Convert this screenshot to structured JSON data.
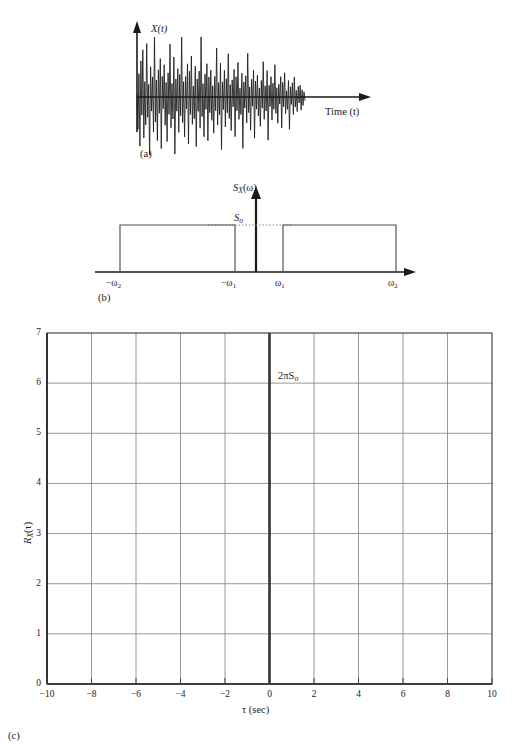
{
  "figure": {
    "panels": [
      {
        "id": "a",
        "caption": "(a)",
        "yaxis_label": "X(t)",
        "xaxis_label": "Time (t)",
        "description": "Sample realization of bandpass random process X(t) versus time"
      },
      {
        "id": "b",
        "caption": "(b)",
        "yaxis_label": "S_X(ω)",
        "level_label": "S_o",
        "tick_labels": [
          "−ω₂",
          "−ω₁",
          "ω₁",
          "ω₂"
        ],
        "description": "Power spectral density of a bandpass process — two rectangles of height S_o"
      },
      {
        "id": "c",
        "caption": "(c)",
        "yaxis_label": "R_X(τ)",
        "xaxis_label": "τ (sec)",
        "impulse_label": "2πS_o",
        "description": "Autocorrelation function R_X(τ) with impulse at τ = 0"
      }
    ]
  },
  "chart_data": [
    {
      "type": "line",
      "panel": "a",
      "title": "",
      "xlabel": "Time (t)",
      "ylabel": "X(t)",
      "grid": false,
      "axes": "arrows",
      "note": "Zero-mean noisy waveform, amplitude decaying toward the right; trace ends before the axis arrow.",
      "x": [
        0,
        1,
        2,
        3,
        4,
        5,
        6,
        7,
        8,
        9,
        10,
        11,
        12,
        13,
        14,
        15,
        16,
        17,
        18,
        19,
        20,
        21,
        22,
        23,
        24,
        25,
        26,
        27,
        28,
        29,
        30,
        31,
        32,
        33,
        34,
        35,
        36,
        37,
        38,
        39,
        40,
        41,
        42,
        43,
        44,
        45,
        46,
        47,
        48,
        49,
        50,
        51,
        52,
        53,
        54,
        55,
        56,
        57,
        58,
        59,
        60,
        61,
        62,
        63,
        64,
        65,
        66,
        67,
        68,
        69,
        70,
        71,
        72,
        73,
        74,
        75,
        76,
        77,
        78,
        79,
        80,
        81,
        82,
        83,
        84,
        85,
        86,
        87,
        88,
        89,
        90,
        91,
        92,
        93,
        94,
        95,
        96,
        97,
        98,
        99,
        100,
        101,
        102,
        103,
        104,
        105,
        106,
        107,
        108,
        109,
        110,
        111,
        112,
        113,
        114,
        115,
        116,
        117,
        118,
        119,
        120,
        121,
        122,
        123,
        124,
        125,
        126,
        127,
        128,
        129,
        130,
        131,
        132,
        133,
        134,
        135,
        136,
        137,
        138,
        139,
        140,
        141,
        142,
        143,
        144,
        145,
        146,
        147,
        148,
        149,
        150,
        151,
        152,
        153,
        154,
        155,
        156,
        157,
        158,
        159,
        160,
        161,
        162,
        163,
        164,
        165,
        166,
        167
      ],
      "values": [
        0.05,
        -0.62,
        0.45,
        -0.95,
        0.7,
        -0.35,
        0.92,
        -0.8,
        0.3,
        -0.55,
        1.05,
        -0.4,
        0.25,
        -1.15,
        0.6,
        -0.28,
        0.4,
        -0.7,
        1.2,
        -0.5,
        0.34,
        -0.88,
        0.55,
        -0.33,
        0.78,
        -1.05,
        0.42,
        -0.24,
        0.66,
        -0.58,
        0.3,
        -0.92,
        0.5,
        -0.36,
        1.1,
        -0.64,
        0.28,
        -0.46,
        0.84,
        -1.2,
        0.38,
        -0.3,
        0.6,
        -0.75,
        0.48,
        -0.4,
        1.28,
        -0.55,
        0.33,
        -0.86,
        0.44,
        -0.26,
        0.72,
        -1.02,
        0.56,
        -0.38,
        0.9,
        -0.6,
        0.24,
        -0.48,
        0.68,
        -1.1,
        0.4,
        -0.32,
        0.58,
        -0.7,
        1.35,
        -0.44,
        0.3,
        -0.9,
        0.52,
        -0.28,
        0.76,
        -1.0,
        0.46,
        -0.36,
        0.62,
        -0.54,
        0.26,
        -0.84,
        0.48,
        -0.32,
        1.15,
        -0.66,
        0.34,
        -0.42,
        0.8,
        -1.25,
        0.36,
        -0.3,
        0.64,
        -0.72,
        0.44,
        -0.38,
        1.05,
        -0.52,
        0.3,
        -0.82,
        0.42,
        -0.24,
        0.68,
        -0.98,
        0.5,
        -0.34,
        0.86,
        -0.56,
        0.22,
        -0.44,
        0.6,
        -1.3,
        0.38,
        -0.28,
        0.54,
        -0.66,
        1.12,
        -0.4,
        0.26,
        -0.86,
        0.46,
        -0.24,
        0.7,
        -1.08,
        0.42,
        -0.32,
        0.58,
        -0.5,
        0.24,
        -0.78,
        0.44,
        -0.3,
        0.95,
        -0.6,
        0.3,
        -0.38,
        0.72,
        -1.18,
        0.32,
        -0.26,
        0.56,
        -0.64,
        0.38,
        -0.34,
        0.9,
        -0.46,
        0.26,
        -0.74,
        0.36,
        -0.2,
        0.58,
        -0.88,
        0.42,
        -0.28,
        0.7,
        -0.48,
        0.18,
        -0.36,
        0.48,
        -0.95,
        0.3,
        -0.22,
        0.42,
        -0.52,
        0.6,
        -0.3,
        0.2,
        -0.44,
        0.32,
        -0.18,
        0.36,
        -0.4,
        0.22,
        -0.26,
        0.16,
        -0.12
      ]
    },
    {
      "type": "area",
      "panel": "b",
      "title": "",
      "xlabel": "",
      "ylabel": "S_X(ω)",
      "grid": false,
      "axes": "arrows",
      "level": "S_o",
      "tick_values": [
        "−ω₂",
        "−ω₁",
        "ω₁",
        "ω₂"
      ],
      "rectangles": [
        {
          "from": "−ω₂",
          "to": "−ω₁",
          "height": "S_o"
        },
        {
          "from": "ω₁",
          "to": "ω₂",
          "height": "S_o"
        }
      ]
    },
    {
      "type": "line",
      "panel": "c",
      "title": "",
      "xlabel": "τ (sec)",
      "ylabel": "R_X(τ)",
      "xlim": [
        -10,
        10
      ],
      "ylim": [
        0,
        7
      ],
      "xticks": [
        -10,
        -8,
        -6,
        -4,
        -2,
        0,
        2,
        4,
        6,
        8,
        10
      ],
      "yticks": [
        0,
        1,
        2,
        3,
        4,
        5,
        6,
        7
      ],
      "grid": true,
      "legend": null,
      "annotations": [
        {
          "text": "2πS_o",
          "x": 0,
          "y": 6.3
        }
      ],
      "series": [
        {
          "name": "impulse at τ = 0",
          "type": "impulse",
          "x": [
            0
          ],
          "values": [
            7
          ]
        }
      ]
    }
  ],
  "panel_a": {
    "caption": "(a)",
    "y_label": "X(t)",
    "x_label": "Time (t)"
  },
  "panel_b": {
    "caption": "(b)",
    "y_label_main": "S",
    "y_label_sub": "X",
    "y_label_arg": "(ω)",
    "level_label_main": "S",
    "level_label_sub": "o",
    "ticks": [
      {
        "label_main": "−ω",
        "label_sub": "2"
      },
      {
        "label_main": "−ω",
        "label_sub": "1"
      },
      {
        "label_main": "ω",
        "label_sub": "1"
      },
      {
        "label_main": "ω",
        "label_sub": "2"
      }
    ]
  },
  "panel_c": {
    "caption": "(c)",
    "y_label_main": "R",
    "y_label_sub": "X",
    "y_label_arg": "(τ)",
    "x_label": "τ (sec)",
    "impulse_label_main": "2πS",
    "impulse_label_sub": "o",
    "x_tick_labels": [
      "−10",
      "−8",
      "−6",
      "−4",
      "−2",
      "0",
      "2",
      "4",
      "6",
      "8",
      "10"
    ],
    "y_tick_labels": [
      "0",
      "1",
      "2",
      "3",
      "4",
      "5",
      "6",
      "7"
    ]
  },
  "colors": {
    "ink": "#1a1a1a",
    "grid": "#8c8c8c",
    "axis": "#222222",
    "impulse": "#333333"
  }
}
